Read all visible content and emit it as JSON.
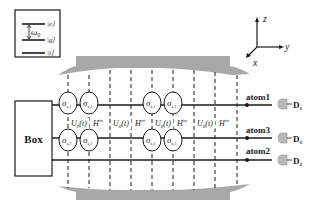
{
  "legend": {
    "levels": [
      {
        "label": "|e⟩"
      },
      {
        "label": "|g⟩"
      },
      {
        "label": "|i⟩"
      }
    ],
    "transition_label": "ω",
    "transition_sub": "0"
  },
  "axes": {
    "z": "z",
    "y": "y",
    "x": "x"
  },
  "box": {
    "label": "Box"
  },
  "atoms": [
    {
      "name": "atom1",
      "detector": "D",
      "detector_sub": "1"
    },
    {
      "name": "atom3",
      "detector": "D",
      "detector_sub": "3"
    },
    {
      "name": "atom2",
      "detector": "D",
      "detector_sub": "2"
    }
  ],
  "operators": {
    "sigma_top": "σ",
    "sigma_top_sub": "x,1",
    "sigma_bottom": "σ",
    "sigma_bottom_sub": "x,3",
    "U0": "U",
    "U0_sub": "0",
    "U0_arg": "(t)",
    "H": "H",
    "H_sup": "int"
  },
  "colors": {
    "line": "#1a1a1a",
    "mirror": "#a8a8a8",
    "detector": "#b8b8b8"
  }
}
